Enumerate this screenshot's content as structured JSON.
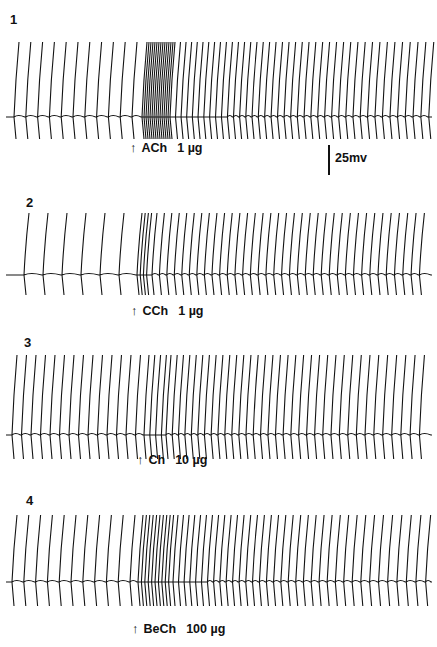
{
  "figure": {
    "panels": [
      {
        "number": "1",
        "drug": "ACh",
        "dose": "1 µg",
        "arrow": "↑",
        "top": 12,
        "numX": 10,
        "numY": 0,
        "baseline": 105,
        "spikeTop": 30,
        "undershoot": 22,
        "arrowX": 133,
        "labelY": 128,
        "pre": {
          "start": 14,
          "interval": 11.8,
          "count": 11
        },
        "burst": {
          "start": 142,
          "interval": 2.0,
          "count": 14
        },
        "post": {
          "start": 170,
          "intervalStart": 5.5,
          "intervalEnd": 8.0,
          "end": 430
        }
      },
      {
        "number": "2",
        "drug": "CCh",
        "dose": "1 µg",
        "arrow": "↑",
        "top": 195,
        "numX": 26,
        "numY": 0,
        "baseline": 80,
        "spikeTop": 18,
        "undershoot": 20,
        "arrowX": 134,
        "labelY": 108,
        "pre": {
          "start": 24,
          "interval": 19.0,
          "count": 6
        },
        "burst": {
          "start": 137,
          "interval": 3.2,
          "count": 4
        },
        "post": {
          "start": 152,
          "intervalStart": 7.4,
          "intervalEnd": 8.4,
          "end": 425
        }
      },
      {
        "number": "3",
        "drug": "Ch",
        "dose": "10 µg",
        "arrow": "↑",
        "top": 335,
        "numX": 24,
        "numY": 0,
        "baseline": 100,
        "spikeTop": 20,
        "undershoot": 24,
        "arrowX": 140,
        "labelY": 117,
        "pre": {
          "start": 12,
          "interval": 9.5,
          "count": 14
        },
        "burst": {
          "start": 144,
          "interval": 5.8,
          "count": 4
        },
        "post": {
          "start": 166,
          "intervalStart": 6.2,
          "intervalEnd": 9.5,
          "end": 420
        }
      },
      {
        "number": "4",
        "drug": "BeCh",
        "dose": "100 µg",
        "arrow": "↑",
        "top": 485,
        "numX": 26,
        "numY": 8,
        "baseline": 97,
        "spikeTop": 30,
        "undershoot": 24,
        "arrowX": 135,
        "labelY": 136,
        "pre": {
          "start": 12,
          "interval": 11.8,
          "count": 11
        },
        "burst": {
          "start": 138,
          "interval": 3.4,
          "count": 10
        },
        "post": {
          "start": 173,
          "intervalStart": 5.5,
          "intervalEnd": 10.0,
          "end": 430
        }
      }
    ],
    "scale_bar": {
      "label": "25mv",
      "x": 328,
      "y": 145,
      "height": 30
    }
  }
}
